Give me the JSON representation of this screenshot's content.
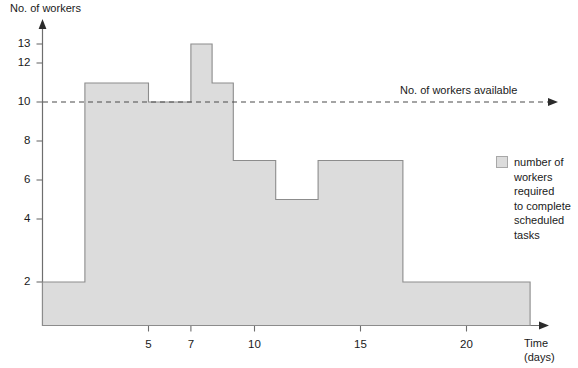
{
  "chart_data": {
    "type": "area",
    "title": "",
    "ylabel": "No. of workers",
    "xlabel": "Time\n(days)",
    "xlabel_line1": "Time",
    "xlabel_line2": "(days)",
    "x_tick_labels": [
      "5",
      "7",
      "10",
      "15",
      "20"
    ],
    "x_tick_values": [
      5,
      7,
      10,
      15,
      20
    ],
    "y_tick_labels": [
      "13",
      "12",
      "10",
      "8",
      "6",
      "4",
      "2"
    ],
    "y_tick_values": [
      13,
      12,
      10,
      8,
      6,
      4,
      2
    ],
    "xlim": [
      0,
      23
    ],
    "ylim": [
      0,
      13.6
    ],
    "grid": false,
    "step_series": {
      "name": "number of workers required to complete scheduled tasks",
      "fill_color": "#dcdcdc",
      "edge_color": "#8c8c8c",
      "intervals": [
        {
          "start": 0,
          "end": 2,
          "value": 2
        },
        {
          "start": 2,
          "end": 5,
          "value": 11
        },
        {
          "start": 5,
          "end": 7,
          "value": 10
        },
        {
          "start": 7,
          "end": 8,
          "value": 13
        },
        {
          "start": 8,
          "end": 9,
          "value": 11
        },
        {
          "start": 9,
          "end": 11,
          "value": 7
        },
        {
          "start": 11,
          "end": 13,
          "value": 5
        },
        {
          "start": 13,
          "end": 17,
          "value": 7
        },
        {
          "start": 17,
          "end": 23,
          "value": 2
        }
      ]
    },
    "reference_line": {
      "label": "No. of workers available",
      "value": 10,
      "style": "dashed",
      "color": "#4a4a4a",
      "arrow": true
    },
    "legend": {
      "position": "right",
      "entries": [
        {
          "swatch_color": "#dcdcdc",
          "lines": [
            "number of",
            "workers",
            "required",
            "to complete",
            "scheduled",
            "tasks"
          ]
        }
      ]
    },
    "annotations": []
  }
}
